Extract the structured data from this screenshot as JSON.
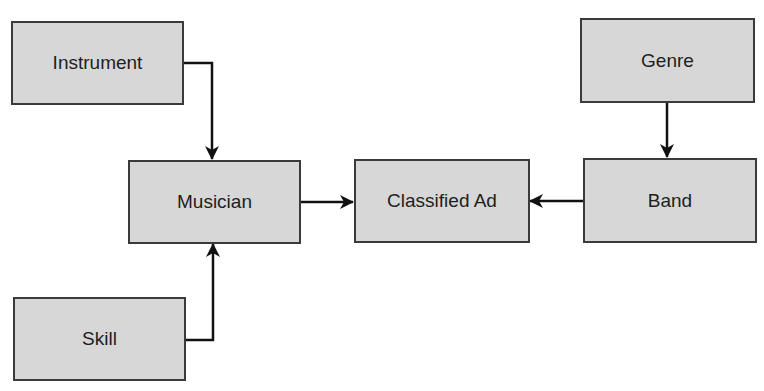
{
  "diagram": {
    "nodes": [
      {
        "id": "instrument",
        "label": "Instrument"
      },
      {
        "id": "musician",
        "label": "Musician"
      },
      {
        "id": "classified_ad",
        "label": "Classified Ad"
      },
      {
        "id": "genre",
        "label": "Genre"
      },
      {
        "id": "band",
        "label": "Band"
      },
      {
        "id": "skill",
        "label": "Skill"
      }
    ],
    "edges": [
      {
        "from": "Instrument",
        "to": "Musician"
      },
      {
        "from": "Skill",
        "to": "Musician"
      },
      {
        "from": "Musician",
        "to": "Classified Ad"
      },
      {
        "from": "Band",
        "to": "Classified Ad"
      },
      {
        "from": "Genre",
        "to": "Band"
      }
    ],
    "colors": {
      "box_fill": "#d7d7d7",
      "box_border": "#3a3a3a",
      "arrow": "#111111"
    }
  }
}
